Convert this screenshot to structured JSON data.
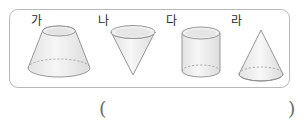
{
  "worksheet": {
    "shapes": [
      {
        "label": "가",
        "name": "truncated-cone",
        "description": "frustum of a cone, wide bottom narrow top",
        "fill": "#f2f2f2",
        "stroke": "#8c8c8c"
      },
      {
        "label": "나",
        "name": "inverted-cone",
        "description": "cone with apex pointing down",
        "fill": "#f2f2f2",
        "stroke": "#8c8c8c"
      },
      {
        "label": "다",
        "name": "cylinder",
        "description": "upright cylinder",
        "fill": "#f2f2f2",
        "stroke": "#8c8c8c"
      },
      {
        "label": "라",
        "name": "cone",
        "description": "upright cone with apex on top",
        "fill": "#f2f2f2",
        "stroke": "#8c8c8c"
      }
    ],
    "answer": {
      "open_paren": "(",
      "close_paren": ")",
      "value": ""
    },
    "colors": {
      "box_border": "#b9b9b9",
      "shape_stroke": "#8c8c8c",
      "shape_fill": "#f2f2f2",
      "text": "#2b2b2b",
      "paren": "#6f6f6f"
    }
  }
}
